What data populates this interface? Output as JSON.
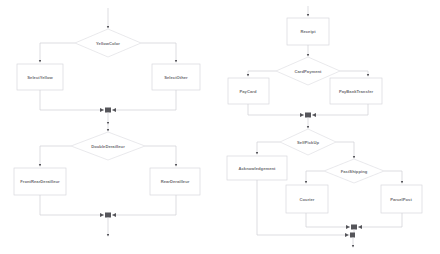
{
  "diagram": {
    "type": "flowchart",
    "title": "",
    "background_color": "#ffffff",
    "node_fill": "#ffffff",
    "node_border_color": "#d8d8dc",
    "edge_color": "#cfcfd4",
    "label_color": "#6e6e72",
    "arrowhead_color": "#55555a"
  },
  "left_flow": {
    "block_a": {
      "decision": "YellowColor",
      "branch_left": "SelectYellow",
      "branch_right": "SelectOther"
    },
    "block_b": {
      "decision": "DoubleDerailleur",
      "branch_left": "FrontRearDerailleur",
      "branch_right": "RearDerailleur"
    }
  },
  "right_flow": {
    "block_a": {
      "start": "Receipt",
      "decision": "CardPayment",
      "branch_left": "PayCard",
      "branch_right": "PayBankTransfer"
    },
    "block_b": {
      "decision": "SelfPickUp",
      "branch_left": "Acknowledgement",
      "decision_nested": "FastShipping",
      "nested_left": "Courier",
      "nested_right": "ParcelPost"
    }
  }
}
